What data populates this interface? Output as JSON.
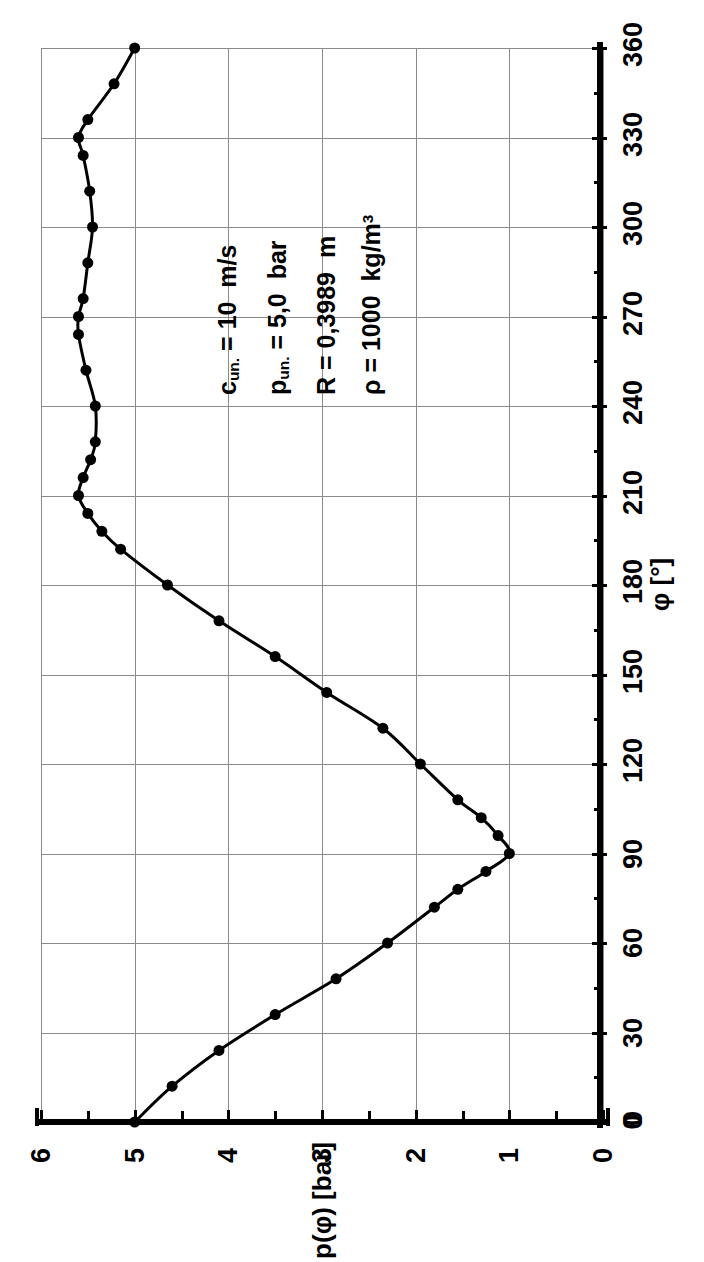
{
  "figure": {
    "orientation": "rotated-90-ccw",
    "background": "#ffffff",
    "ink_color": "#000000",
    "grid_color": "#8a8a8a"
  },
  "axes": {
    "value_axis": {
      "title": "p(φ) [bar]",
      "unit": "bar",
      "ticks": [
        "6",
        "5",
        "4",
        "3",
        "2",
        "1",
        "0"
      ],
      "tick_values": [
        6,
        5,
        4,
        3,
        2,
        1,
        0
      ],
      "minor_step": 0.5,
      "range": [
        0,
        6
      ]
    },
    "angle_axis": {
      "title": "φ [°]",
      "unit": "degree",
      "ticks": [
        "0",
        "30",
        "60",
        "90",
        "120",
        "150",
        "180",
        "210",
        "240",
        "270",
        "300",
        "330",
        "360"
      ],
      "tick_values": [
        0,
        30,
        60,
        90,
        120,
        150,
        180,
        210,
        240,
        270,
        300,
        330,
        360
      ],
      "minor_step": 15,
      "range": [
        0,
        360
      ],
      "origin_zero_label": "0"
    }
  },
  "annotation": {
    "lines": [
      {
        "id": "c-line",
        "symbol": "c",
        "symbol_sub": "un.",
        "rest": " = 10  m/s"
      },
      {
        "id": "p-line",
        "symbol": "p",
        "symbol_sub": "un.",
        "rest": " = 5,0  bar"
      },
      {
        "id": "r-line",
        "symbol": "R",
        "symbol_sub": "",
        "rest": " = 0,3989  m"
      },
      {
        "id": "rho-line",
        "symbol": "ρ",
        "symbol_sub": "",
        "rest": " = 1000  kg/m",
        "sup": "3"
      }
    ]
  },
  "chart_data": {
    "type": "line",
    "title": "",
    "xlabel": "φ [°]",
    "ylabel": "p(φ) [bar]",
    "xlim": [
      0,
      360
    ],
    "ylim": [
      0,
      6
    ],
    "grid": true,
    "legend": "none",
    "marker": "filled-circle",
    "marker_size_px": 11,
    "line_width_px": 3,
    "series": [
      {
        "name": "p(φ)",
        "color": "#000000",
        "x": [
          0,
          12,
          24,
          36,
          48,
          60,
          72,
          78,
          84,
          90,
          96,
          102,
          108,
          120,
          132,
          144,
          156,
          168,
          180,
          192,
          198,
          204,
          210,
          216,
          222,
          228,
          240,
          252,
          264,
          270,
          276,
          288,
          300,
          312,
          324,
          330,
          336,
          348,
          360
        ],
        "y": [
          5.0,
          4.6,
          4.1,
          3.5,
          2.85,
          2.3,
          1.8,
          1.55,
          1.25,
          1.0,
          1.12,
          1.3,
          1.55,
          1.95,
          2.35,
          2.95,
          3.5,
          4.1,
          4.65,
          5.15,
          5.35,
          5.5,
          5.6,
          5.55,
          5.47,
          5.42,
          5.42,
          5.52,
          5.6,
          5.6,
          5.55,
          5.5,
          5.45,
          5.48,
          5.55,
          5.6,
          5.5,
          5.22,
          5.0
        ]
      }
    ]
  }
}
